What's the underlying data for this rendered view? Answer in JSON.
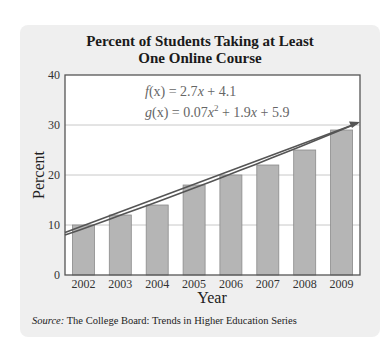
{
  "chart_data": {
    "type": "bar",
    "title": "Percent of Students Taking at Least One Online Course",
    "title_lines": [
      "Percent of Students Taking at Least",
      "One Online Course"
    ],
    "xlabel": "Year",
    "ylabel": "Percent",
    "categories": [
      "2002",
      "2003",
      "2004",
      "2005",
      "2006",
      "2007",
      "2008",
      "2009"
    ],
    "values": [
      10,
      12,
      14,
      18,
      20,
      22,
      25,
      29
    ],
    "ylim": [
      0,
      40
    ],
    "yticks": [
      0,
      10,
      20,
      30,
      40
    ],
    "grid": "horizontal",
    "models": [
      {
        "name": "f",
        "equation": "f(x) = 2.7x + 4.1",
        "type": "linear"
      },
      {
        "name": "g",
        "equation": "g(x) = 0.07x^2 + 1.9x + 5.9",
        "type": "quadratic"
      }
    ],
    "annotations": [
      "f(x) = 2.7x + 4.1",
      "g(x) = 0.07x² + 1.9x + 5.9"
    ],
    "source": "Source: The College Board: Trends in Higher Education Series"
  },
  "header": {
    "title_line1": "Percent of Students Taking at Least",
    "title_line2": "One Online Course"
  },
  "equations": {
    "f_name": "f",
    "f_arg": "(x)",
    "f_rhs_pre": " = 2.7",
    "f_var": "x",
    "f_rhs_post": " + 4.1",
    "g_name": "g",
    "g_arg": "(x)",
    "g_rhs_pre": " = 0.07",
    "g_var1": "x",
    "g_exp": "2",
    "g_mid": " + 1.9",
    "g_var2": "x",
    "g_rhs_post": " + 5.9"
  },
  "axes": {
    "ylabel": "Percent",
    "xlabel": "Year",
    "yticks": [
      "0",
      "10",
      "20",
      "30",
      "40"
    ],
    "xticks": [
      "2002",
      "2003",
      "2004",
      "2005",
      "2006",
      "2007",
      "2008",
      "2009"
    ]
  },
  "footer": {
    "source_label": "Source:",
    "source_text": " The College Board: Trends in Higher Education Series"
  },
  "colors": {
    "panel": "#efefef",
    "plot_bg": "#ffffff",
    "bar_fill": "#b5b5b5",
    "bar_stroke": "#8a8a8a",
    "trend_line": "#555555",
    "grid": "#c8c8c8",
    "axis": "#555555"
  }
}
